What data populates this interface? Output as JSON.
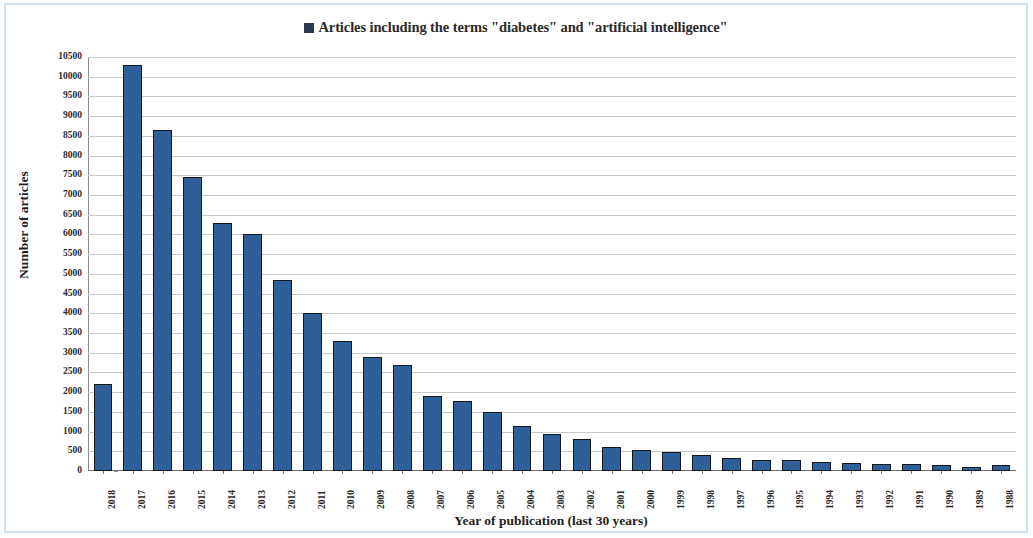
{
  "chart_data": {
    "type": "bar",
    "title": "Articles including the terms \"diabetes\" and \"artificial intelligence\"",
    "legend": [
      {
        "label": "Articles including the terms \"diabetes\" and \"artificial intelligence\"",
        "color": "#2d3a52",
        "marker": "square"
      }
    ],
    "legend_position": "top-center",
    "xlabel": "Year of publication (last 30 years)",
    "ylabel": "Number of articles",
    "ylim": [
      0,
      10500
    ],
    "ytick_step": 500,
    "grid": true,
    "grid_axis": "y",
    "bar_color": "#2e5f99",
    "bar_border_color": "#14171c",
    "categories": [
      "2018",
      "2017",
      "2016",
      "2015",
      "2014",
      "2013",
      "2012",
      "2011",
      "2010",
      "2009",
      "2008",
      "2007",
      "2006",
      "2005",
      "2004",
      "2003",
      "2002",
      "2001",
      "2000",
      "1999",
      "1998",
      "1997",
      "1996",
      "1995",
      "1994",
      "1993",
      "1992",
      "1991",
      "1990",
      "1989",
      "1988"
    ],
    "values": [
      2200,
      10300,
      8650,
      7450,
      6300,
      6000,
      4850,
      4000,
      3300,
      2900,
      2700,
      1900,
      1780,
      1500,
      1150,
      950,
      800,
      620,
      530,
      480,
      400,
      340,
      290,
      280,
      220,
      200,
      180,
      170,
      150,
      90,
      140
    ],
    "yticks": [
      "0",
      "500",
      "1000",
      "1500",
      "2000",
      "2500",
      "3000",
      "3500",
      "4000",
      "4500",
      "5000",
      "5500",
      "6000",
      "6500",
      "7000",
      "7500",
      "8000",
      "8500",
      "9000",
      "9500",
      "10000",
      "10500"
    ]
  }
}
